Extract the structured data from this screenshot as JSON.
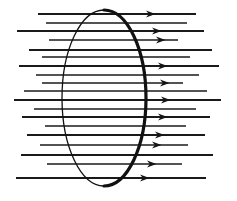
{
  "figure": {
    "background_color": "#ffffff",
    "ink_color": "#141414",
    "canvas": {
      "width": 237,
      "height": 201
    }
  },
  "surface": {
    "name": "elliptical-surface",
    "shape": "ellipse",
    "center_x": 104,
    "center_y": 98,
    "radius_x": 42,
    "radius_y": 88,
    "stroke_color": "#111111",
    "thin_stroke_width": 1.3,
    "thick_stroke_width": 3.2,
    "note": "Left arc rendered thin, right arc rendered thick to suggest a tilted circular loop."
  },
  "field": {
    "name": "uniform-field",
    "direction": "left-to-right",
    "arrow_color": "#141414",
    "line_color": "#1a1a1a",
    "line_count": 19,
    "lines": [
      {
        "y": 14,
        "x1": 38,
        "x2": 196,
        "width": 1.9,
        "arrow": true,
        "arrow_x": 146
      },
      {
        "y": 23,
        "x1": 46,
        "x2": 187,
        "width": 1.5,
        "arrow": false,
        "arrow_x": 0
      },
      {
        "y": 31,
        "x1": 17,
        "x2": 204,
        "width": 1.9,
        "arrow": true,
        "arrow_x": 152
      },
      {
        "y": 40,
        "x1": 49,
        "x2": 178,
        "width": 1.4,
        "arrow": true,
        "arrow_x": 156
      },
      {
        "y": 50,
        "x1": 29,
        "x2": 212,
        "width": 1.9,
        "arrow": false,
        "arrow_x": 0
      },
      {
        "y": 57,
        "x1": 42,
        "x2": 190,
        "width": 1.4,
        "arrow": false,
        "arrow_x": 0
      },
      {
        "y": 66,
        "x1": 19,
        "x2": 219,
        "width": 2.1,
        "arrow": true,
        "arrow_x": 158
      },
      {
        "y": 75,
        "x1": 36,
        "x2": 199,
        "width": 1.5,
        "arrow": false,
        "arrow_x": 0
      },
      {
        "y": 83,
        "x1": 42,
        "x2": 183,
        "width": 1.5,
        "arrow": true,
        "arrow_x": 160
      },
      {
        "y": 91,
        "x1": 24,
        "x2": 207,
        "width": 1.6,
        "arrow": false,
        "arrow_x": 0
      },
      {
        "y": 100,
        "x1": 14,
        "x2": 221,
        "width": 2.1,
        "arrow": true,
        "arrow_x": 161
      },
      {
        "y": 109,
        "x1": 34,
        "x2": 196,
        "width": 1.5,
        "arrow": false,
        "arrow_x": 0
      },
      {
        "y": 117,
        "x1": 22,
        "x2": 210,
        "width": 1.9,
        "arrow": true,
        "arrow_x": 158
      },
      {
        "y": 126,
        "x1": 45,
        "x2": 186,
        "width": 1.4,
        "arrow": false,
        "arrow_x": 0
      },
      {
        "y": 135,
        "x1": 27,
        "x2": 205,
        "width": 1.9,
        "arrow": true,
        "arrow_x": 155
      },
      {
        "y": 145,
        "x1": 40,
        "x2": 188,
        "width": 1.5,
        "arrow": true,
        "arrow_x": 152
      },
      {
        "y": 155,
        "x1": 21,
        "x2": 213,
        "width": 1.9,
        "arrow": false,
        "arrow_x": 0
      },
      {
        "y": 164,
        "x1": 47,
        "x2": 182,
        "width": 1.4,
        "arrow": true,
        "arrow_x": 147
      },
      {
        "y": 178,
        "x1": 16,
        "x2": 206,
        "width": 1.9,
        "arrow": true,
        "arrow_x": 140
      }
    ]
  }
}
